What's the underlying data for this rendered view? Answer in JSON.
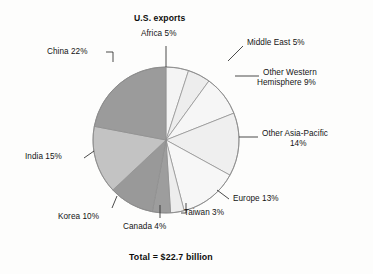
{
  "chart_data": {
    "type": "pie",
    "title": "U.S. exports",
    "footnote": "Total = $22.7 billion",
    "total_label": "$22.7 billion",
    "units": "percent of total",
    "legend_position": "none-callout-labels",
    "start_angle_deg": 0,
    "direction": "clockwise",
    "categories": [
      "Africa",
      "Middle East",
      "Other Western Hemisphere",
      "Other Asia-Pacific",
      "Europe",
      "Taiwan",
      "Canada",
      "Korea",
      "India",
      "China"
    ],
    "values": [
      5,
      5,
      9,
      14,
      13,
      3,
      4,
      10,
      15,
      22
    ],
    "slices": [
      {
        "name": "Africa",
        "value": 5,
        "label": "Africa 5%",
        "color": "#f4f4f4"
      },
      {
        "name": "Middle East",
        "value": 5,
        "label": "Middle East 5%",
        "color": "#ededed"
      },
      {
        "name": "Other Western Hemisphere",
        "value": 9,
        "label": "Other Western Hemisphere 9%",
        "color": "#f6f6f6"
      },
      {
        "name": "Other Asia-Pacific",
        "value": 14,
        "label": "Other Asia-Pacific 14%",
        "color": "#efefef"
      },
      {
        "name": "Europe",
        "value": 13,
        "label": "Europe 13%",
        "color": "#f7f7f7"
      },
      {
        "name": "Taiwan",
        "value": 3,
        "label": "Taiwan 3%",
        "color": "#ededed"
      },
      {
        "name": "Canada",
        "value": 4,
        "label": "Canada 4%",
        "color": "#9d9d9d"
      },
      {
        "name": "Korea",
        "value": 10,
        "label": "Korea 10%",
        "color": "#999999"
      },
      {
        "name": "India",
        "value": 15,
        "label": "India 15%",
        "color": "#c3c3c3"
      },
      {
        "name": "China",
        "value": 22,
        "label": "China 22%",
        "color": "#9b9b9b"
      }
    ]
  },
  "labels": {
    "africa": "Africa 5%",
    "middle_east": "Middle East 5%",
    "other_western_hemisphere_line1": "Other Western",
    "other_western_hemisphere_line2": "Hemisphere 9%",
    "other_asia_pacific_line1": "Other Asia-Pacific",
    "other_asia_pacific_line2": "14%",
    "europe": "Europe 13%",
    "taiwan": "Taiwan 3%",
    "canada": "Canada 4%",
    "korea": "Korea 10%",
    "india": "India 15%",
    "china": "China 22%"
  },
  "title": "U.S. exports",
  "footer": "Total = $22.7 billion"
}
